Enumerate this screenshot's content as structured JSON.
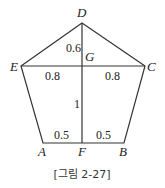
{
  "figure": {
    "caption": "[그림 2-27]",
    "shape": "pentagon",
    "points": {
      "D": {
        "label": "D",
        "x": 82,
        "y": 23
      },
      "E": {
        "label": "E",
        "x": 21,
        "y": 66
      },
      "C": {
        "label": "C",
        "x": 145,
        "y": 66
      },
      "A": {
        "label": "A",
        "x": 43,
        "y": 143
      },
      "B": {
        "label": "B",
        "x": 124,
        "y": 143
      },
      "F": {
        "label": "F",
        "x": 82,
        "y": 143
      },
      "G": {
        "label": "G",
        "x": 82,
        "y": 66
      }
    },
    "segments": [
      "DE",
      "DC",
      "EA",
      "CB",
      "AB",
      "EC",
      "DF"
    ],
    "measurements": {
      "DG": "0.6",
      "EG": "0.8",
      "GC": "0.8",
      "GF": "1",
      "AF": "0.5",
      "FB": "0.5"
    }
  }
}
